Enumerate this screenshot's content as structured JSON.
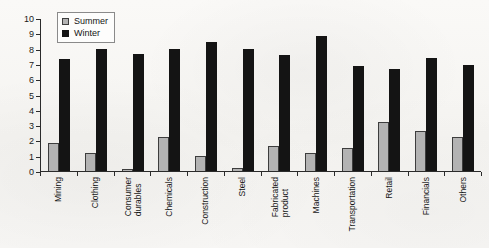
{
  "chart_data": {
    "type": "bar",
    "title": "",
    "xlabel": "",
    "ylabel": "",
    "ylim": [
      0,
      10
    ],
    "yticks": [
      0,
      1,
      2,
      3,
      4,
      5,
      6,
      7,
      8,
      9,
      10
    ],
    "grid": false,
    "legend_position": "top-left",
    "categories": [
      "Mining",
      "Clothing",
      "Consumer\ndurables",
      "Chemicals",
      "Construction",
      "Steel",
      "Fabricated\nproduct",
      "Machines",
      "Transportation",
      "Retail",
      "Financials",
      "Others"
    ],
    "series": [
      {
        "name": "Summer",
        "color": "#b3b3b3",
        "values": [
          1.8,
          1.2,
          0.1,
          2.25,
          1.0,
          0.2,
          1.65,
          1.15,
          1.5,
          3.2,
          2.6,
          2.25
        ]
      },
      {
        "name": "Winter",
        "color": "#141414",
        "values": [
          7.3,
          8.0,
          7.65,
          8.0,
          8.4,
          8.0,
          7.6,
          8.8,
          6.85,
          6.7,
          7.4,
          6.95
        ]
      }
    ]
  },
  "colors": {
    "summer": "#b3b3b3",
    "winter": "#141414",
    "axis": "#2b2b2b",
    "background": "#f7f6f4"
  }
}
